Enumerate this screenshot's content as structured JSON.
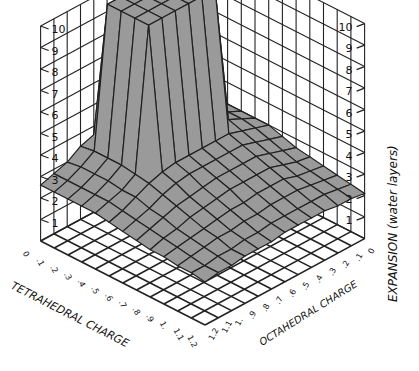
{
  "chart_data": {
    "type": "surface3d",
    "title": "",
    "xlabel": "TETRAHEDRAL CHARGE",
    "ylabel": "OCTAHEDRAL CHARGE",
    "zlabel": "EXPANSION (water layers)",
    "x_ticks": [
      "0",
      ".1",
      ".2",
      ".3",
      ".4",
      ".5",
      ".6",
      ".7",
      ".8",
      ".9",
      "1.",
      "1.1",
      "1.2"
    ],
    "y_ticks": [
      "0",
      ".1",
      ".2",
      ".3",
      ".4",
      ".5",
      ".6",
      ".7",
      ".8",
      ".9",
      "1.",
      "1.1",
      "1.2"
    ],
    "z_ticks": [
      "1",
      "2",
      "3",
      "4",
      "5",
      "6",
      "7",
      "8",
      "9",
      "10"
    ],
    "zlim": [
      0,
      10
    ],
    "grid": true,
    "colors": {
      "surface": "#9a9a9a",
      "lines": "#222222",
      "background": "#ffffff"
    },
    "x": [
      0,
      0.1,
      0.2,
      0.3,
      0.4,
      0.5,
      0.6,
      0.7,
      0.8,
      0.9,
      1.0,
      1.1,
      1.2
    ],
    "y": [
      0,
      0.1,
      0.2,
      0.3,
      0.4,
      0.5,
      0.6,
      0.7,
      0.8,
      0.9,
      1.0,
      1.1,
      1.2
    ],
    "z": [
      [
        3,
        3.3,
        3.6,
        3.6,
        3.6,
        3.6,
        3.6,
        3.6,
        3.6,
        3.4,
        3,
        2.8,
        2.6
      ],
      [
        3,
        3.3,
        3.8,
        10,
        10,
        10,
        10,
        10,
        10,
        3.5,
        3.1,
        2.8,
        2.6
      ],
      [
        3,
        3.3,
        3.8,
        10,
        10,
        10,
        10,
        10,
        10,
        3.5,
        3.1,
        2.8,
        2.6
      ],
      [
        3,
        3.3,
        3.8,
        10,
        10,
        10,
        10,
        10,
        10,
        3.5,
        3.1,
        2.8,
        2.6
      ],
      [
        3,
        3.3,
        3.6,
        10,
        10,
        10,
        10,
        10,
        10,
        3.4,
        3,
        2.8,
        2.6
      ],
      [
        3,
        3.2,
        3.4,
        3.6,
        3.6,
        3.6,
        3.6,
        3.6,
        3.5,
        3.3,
        3,
        2.7,
        2.5
      ],
      [
        2.8,
        3,
        3.2,
        3.4,
        3.4,
        3.4,
        3.4,
        3.4,
        3.3,
        3.1,
        2.8,
        2.6,
        2.4
      ],
      [
        2.6,
        2.8,
        3,
        3.2,
        3.2,
        3.2,
        3.2,
        3.1,
        3,
        2.9,
        2.7,
        2.5,
        2.3
      ],
      [
        2.5,
        2.6,
        2.8,
        3,
        3,
        3,
        3,
        2.9,
        2.8,
        2.7,
        2.5,
        2.4,
        2.2
      ],
      [
        2.4,
        2.5,
        2.6,
        2.8,
        2.8,
        2.8,
        2.7,
        2.7,
        2.6,
        2.5,
        2.4,
        2.3,
        2.2
      ],
      [
        2.3,
        2.4,
        2.5,
        2.6,
        2.6,
        2.6,
        2.5,
        2.5,
        2.4,
        2.4,
        2.3,
        2.2,
        2.1
      ],
      [
        2.2,
        2.3,
        2.4,
        2.4,
        2.4,
        2.4,
        2.4,
        2.3,
        2.3,
        2.2,
        2.2,
        2.1,
        2.1
      ],
      [
        2.1,
        2.2,
        2.2,
        2.3,
        2.3,
        2.3,
        2.3,
        2.2,
        2.2,
        2.2,
        2.1,
        2.1,
        2.0
      ]
    ]
  }
}
